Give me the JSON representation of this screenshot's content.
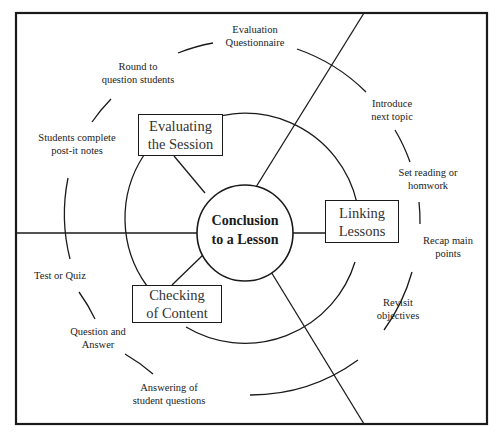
{
  "diagram": {
    "center": {
      "line1": "Conclusion",
      "line2": "to  a Lesson"
    },
    "segments": [
      {
        "id": "evaluating",
        "line1": "Evaluating",
        "line2": "the Session"
      },
      {
        "id": "linking",
        "line1": "Linking",
        "line2": "Lessons"
      },
      {
        "id": "checking",
        "line1": "Checking",
        "line2": "of Content"
      }
    ],
    "outer_items": [
      {
        "line1": "Evaluation",
        "line2": "Questionnaire"
      },
      {
        "line1": "Round to",
        "line2": "question students"
      },
      {
        "line1": "Students complete",
        "line2": "post-it notes"
      },
      {
        "line1": "Introduce",
        "line2": "next topic"
      },
      {
        "line1": "Set reading or",
        "line2": "homwork"
      },
      {
        "line1": "Recap main",
        "line2": "points"
      },
      {
        "line1": "Revisit",
        "line2": "objectives"
      },
      {
        "line1": "Test or Quiz",
        "line2": ""
      },
      {
        "line1": "Question and",
        "line2": "Answer"
      },
      {
        "line1": "Answering of",
        "line2": "student questions"
      }
    ],
    "colors": {
      "line": "#1a1a1a",
      "background": "#ffffff"
    }
  }
}
